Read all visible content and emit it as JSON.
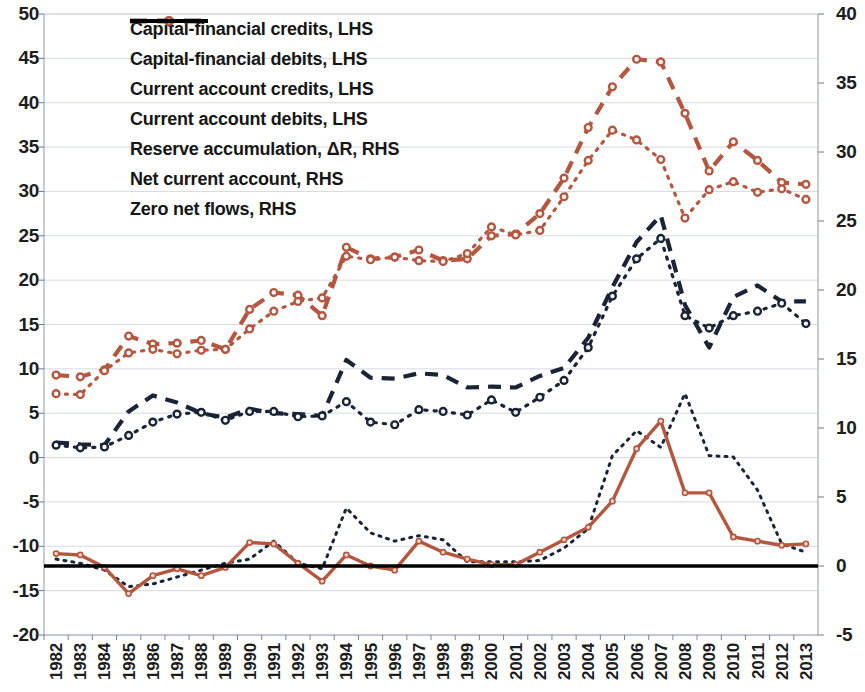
{
  "chart_data": {
    "type": "line",
    "title": "",
    "xlabel": "",
    "ylabel": "",
    "grid": true,
    "legend_position": "top-center-inside",
    "x": [
      1982,
      1983,
      1984,
      1985,
      1986,
      1987,
      1988,
      1989,
      1990,
      1991,
      1992,
      1993,
      1994,
      1995,
      1996,
      1997,
      1998,
      1999,
      2000,
      2001,
      2002,
      2003,
      2004,
      2005,
      2006,
      2007,
      2008,
      2009,
      2010,
      2011,
      2012,
      2013
    ],
    "xtick_labels": [
      "1982",
      "1983",
      "1984",
      "1985",
      "1986",
      "1987",
      "1988",
      "1989",
      "1990",
      "1991",
      "1992",
      "1993",
      "1994",
      "1995",
      "1996",
      "1997",
      "1998",
      "1999",
      "2000",
      "2001",
      "2002",
      "2003",
      "2004",
      "2005",
      "2006",
      "2007",
      "2008",
      "2009",
      "2010",
      "2011",
      "2012",
      "2013"
    ],
    "axes": {
      "left": {
        "label": "LHS",
        "min": -20,
        "max": 50,
        "step": 5,
        "ticks": [
          "50",
          "45",
          "40",
          "35",
          "30",
          "25",
          "20",
          "15",
          "10",
          "5",
          "0",
          "-5",
          "-10",
          "-15",
          "-20"
        ]
      },
      "right": {
        "label": "RHS",
        "min": -5,
        "max": 40,
        "step": 5,
        "ticks": [
          "40",
          "35",
          "30",
          "25",
          "20",
          "15",
          "10",
          "5",
          "0",
          "-5"
        ]
      }
    },
    "series": [
      {
        "name": "Capital-financial credits, LHS",
        "axis": "left",
        "color": "#1b2436",
        "style": "dashed",
        "marker": "none",
        "values": [
          1.7,
          1.5,
          1.4,
          5.2,
          7.0,
          6.2,
          5.0,
          4.5,
          5.5,
          5.0,
          4.9,
          4.7,
          11.0,
          9.0,
          8.9,
          9.5,
          9.3,
          7.9,
          8.0,
          7.9,
          9.2,
          10.1,
          13.5,
          19.2,
          24.3,
          27.3,
          17.2,
          12.4,
          18.1,
          19.4,
          17.6,
          17.6
        ]
      },
      {
        "name": "Capital-financial debits, LHS",
        "axis": "left",
        "color": "#1b2436",
        "style": "dotted",
        "marker": "circle",
        "values": [
          1.4,
          1.1,
          1.2,
          2.5,
          4.0,
          4.9,
          5.1,
          4.2,
          5.2,
          5.2,
          4.6,
          4.7,
          6.3,
          4.0,
          3.7,
          5.4,
          5.2,
          4.8,
          6.5,
          5.1,
          6.8,
          8.7,
          12.4,
          18.2,
          22.4,
          24.7,
          16.0,
          14.6,
          16.0,
          16.5,
          17.4,
          15.1
        ]
      },
      {
        "name": "Current account credits, LHS",
        "axis": "left",
        "color": "#b5563f",
        "style": "dashed",
        "marker": "circle",
        "values": [
          9.3,
          9.1,
          9.9,
          13.7,
          12.8,
          12.9,
          13.2,
          12.2,
          16.7,
          18.6,
          18.3,
          16.0,
          23.7,
          22.4,
          22.6,
          23.4,
          22.2,
          22.4,
          25.0,
          25.2,
          27.5,
          31.5,
          37.2,
          41.8,
          44.9,
          44.6,
          38.8,
          32.3,
          35.6,
          33.5,
          31.0,
          30.8
        ]
      },
      {
        "name": "Current account debits, LHS",
        "axis": "left",
        "color": "#b5563f",
        "style": "dotted",
        "marker": "circle",
        "values": [
          7.2,
          7.1,
          9.8,
          11.8,
          12.2,
          11.7,
          12.1,
          12.2,
          14.5,
          16.5,
          17.6,
          18.0,
          22.7,
          22.3,
          22.6,
          22.2,
          22.1,
          23.0,
          26.0,
          25.1,
          25.6,
          29.4,
          33.5,
          36.9,
          35.8,
          33.6,
          27.0,
          30.2,
          31.1,
          29.9,
          30.3,
          29.1
        ]
      },
      {
        "name": "Reserve accumulation, ΔR, RHS",
        "axis": "right",
        "color": "#1b2436",
        "style": "dotted-fine",
        "marker": "none",
        "values": [
          0.5,
          0.2,
          -0.3,
          -1.5,
          -1.3,
          -0.8,
          -0.3,
          0.2,
          0.5,
          1.8,
          0.2,
          -0.2,
          4.2,
          2.4,
          1.8,
          2.2,
          1.9,
          0.3,
          0.3,
          0.3,
          0.4,
          1.3,
          2.7,
          8.0,
          9.8,
          8.6,
          12.5,
          8.0,
          7.9,
          5.5,
          1.6,
          1.0
        ]
      },
      {
        "name": "Net current account, RHS",
        "axis": "right",
        "color": "#b5563f",
        "style": "solid",
        "marker": "circle-open",
        "values": [
          0.9,
          0.8,
          -0.1,
          -2.0,
          -0.7,
          -0.2,
          -0.7,
          -0.1,
          1.7,
          1.6,
          0.2,
          -1.1,
          0.8,
          0.0,
          -0.3,
          1.8,
          1.0,
          0.5,
          0.1,
          0.1,
          1.0,
          1.9,
          2.8,
          4.7,
          8.5,
          10.5,
          5.3,
          5.3,
          2.1,
          1.8,
          1.5,
          1.6
        ]
      },
      {
        "name": "Zero net flows, RHS",
        "axis": "right",
        "color": "#000000",
        "style": "solid-thick",
        "marker": "none",
        "constant": 0
      }
    ],
    "legend_entries": [
      {
        "label": "Capital-financial credits, LHS",
        "color": "#1b2436",
        "style": "dashed"
      },
      {
        "label": "Capital-financial debits, LHS",
        "color": "#1b2436",
        "style": "dotted-marker"
      },
      {
        "label": "Current account credits, LHS",
        "color": "#b5563f",
        "style": "dashed-marker"
      },
      {
        "label": "Current account debits, LHS",
        "color": "#b5563f",
        "style": "dotted-marker"
      },
      {
        "label": "Reserve accumulation, ΔR, RHS",
        "color": "#1b2436",
        "style": "dotted-fine"
      },
      {
        "label": "Net current account, RHS",
        "color": "#b5563f",
        "style": "solid"
      },
      {
        "label": "Zero net flows, RHS",
        "color": "#000000",
        "style": "solid-thick"
      }
    ]
  }
}
